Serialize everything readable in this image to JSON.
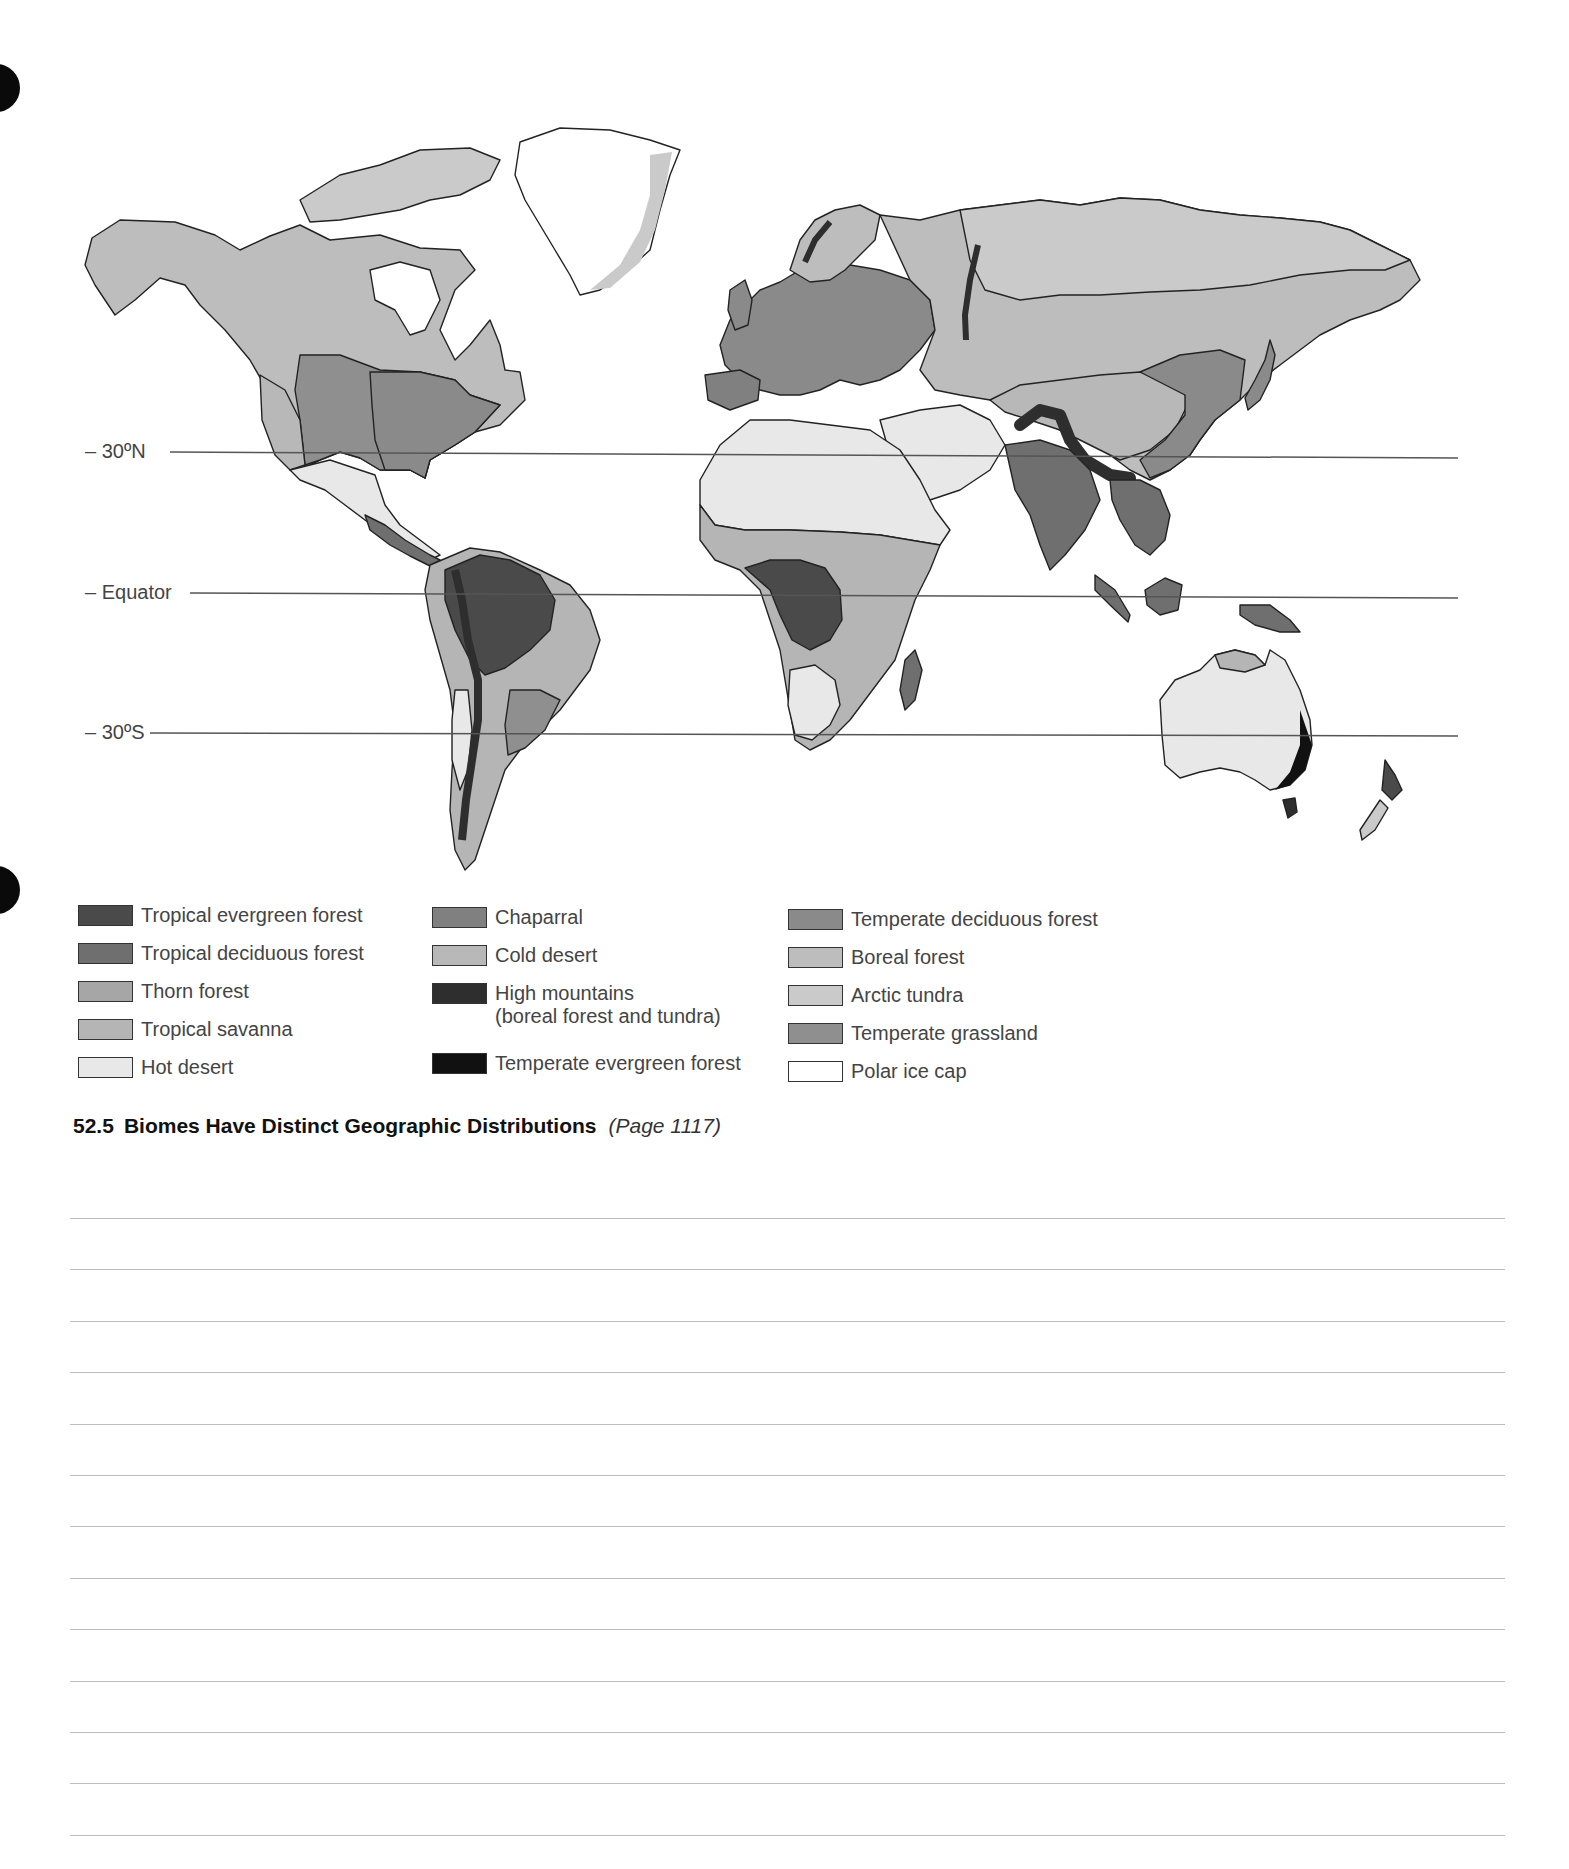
{
  "map": {
    "latitude_lines": [
      {
        "label": "– 30ºN",
        "y": 452
      },
      {
        "label": "– Equator",
        "y": 593
      },
      {
        "label": "– 30ºS",
        "y": 733
      }
    ]
  },
  "legend": {
    "columns": [
      [
        {
          "label": "Tropical evergreen forest",
          "color": "#4a4a4a"
        },
        {
          "label": "Tropical deciduous forest",
          "color": "#6f6f6f"
        },
        {
          "label": "Thorn forest",
          "color": "#a6a6a6"
        },
        {
          "label": "Tropical savanna",
          "color": "#b5b5b5"
        },
        {
          "label": "Hot desert",
          "color": "#e8e8e8"
        }
      ],
      [
        {
          "label": "Chaparral",
          "color": "#808080"
        },
        {
          "label": "Cold desert",
          "color": "#b8b8b8"
        },
        {
          "label": "High mountains",
          "label2": "(boreal forest and tundra)",
          "color": "#2e2e2e"
        },
        {
          "label": "Temperate evergreen forest",
          "color": "#111111"
        }
      ],
      [
        {
          "label": "Temperate deciduous forest",
          "color": "#8a8a8a"
        },
        {
          "label": "Boreal forest",
          "color": "#bdbdbd"
        },
        {
          "label": "Arctic tundra",
          "color": "#cacaca"
        },
        {
          "label": "Temperate grassland",
          "color": "#8f8f8f"
        },
        {
          "label": "Polar ice cap",
          "color": "#ffffff"
        }
      ]
    ]
  },
  "caption": {
    "number": "52.5",
    "title": "Biomes Have Distinct Geographic Distributions",
    "page_ref": "(Page 1117)"
  },
  "answer_lines": {
    "count": 13
  }
}
